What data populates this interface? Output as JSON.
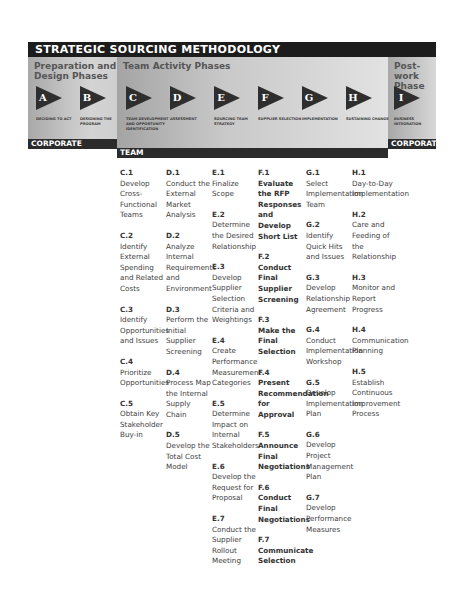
{
  "title": "STRATEGIC SOURCING METHODOLOGY",
  "colors": {
    "title_bar": "#1c1c1c",
    "triangle": "#2e2e2e",
    "footer_bar": "#2b2b2b"
  },
  "sections": {
    "prep": {
      "title_line1": "Preparation and",
      "title_line2": "Design Phases",
      "footer": "CORPORATE"
    },
    "team": {
      "title": "Team Activity Phases",
      "footer": "TEAM"
    },
    "post": {
      "title_line1": "Post-work",
      "title_line2": "Phase",
      "footer": "CORPORATE"
    }
  },
  "phases": [
    {
      "letter": "A",
      "label": "Deciding to Act"
    },
    {
      "letter": "B",
      "label": "Designing the Program"
    },
    {
      "letter": "C",
      "label": "Team Development and Opportunity Identification"
    },
    {
      "letter": "D",
      "label": "Assessment"
    },
    {
      "letter": "E",
      "label": "Sourcing Team Strategy"
    },
    {
      "letter": "F",
      "label": "Supplier Selection"
    },
    {
      "letter": "G",
      "label": "Implementation"
    },
    {
      "letter": "H",
      "label": "Sustaining Change"
    },
    {
      "letter": "I",
      "label": "Business Integration"
    }
  ],
  "columns": {
    "C": [
      {
        "id": "C.1",
        "text": "Develop Cross-Functional Teams"
      },
      {
        "id": "C.2",
        "text": "Identify External Spending and Related Costs"
      },
      {
        "id": "C.3",
        "text": "Identify Opportunities and Issues"
      },
      {
        "id": "C.4",
        "text": "Prioritize Opportunities"
      },
      {
        "id": "C.5",
        "text": "Obtain Key Stakeholder Buy-in"
      }
    ],
    "D": [
      {
        "id": "D.1",
        "text": "Conduct the External Market Analysis"
      },
      {
        "id": "D.2",
        "text": "Analyze Internal Requirements and Environment"
      },
      {
        "id": "D.3",
        "text": "Perform the Initial Supplier Screening"
      },
      {
        "id": "D.4",
        "text": "Process Map the Internal Supply Chain"
      },
      {
        "id": "D.5",
        "text": "Develop the Total Cost Model"
      }
    ],
    "E": [
      {
        "id": "E.1",
        "text": "Finalize Scope"
      },
      {
        "id": "E.2",
        "text": "Determine the Desired Relationship"
      },
      {
        "id": "E.3",
        "text": "Develop Supplier Selection Criteria and Weightings"
      },
      {
        "id": "E.4",
        "text": "Create Performance Measurement Categories"
      },
      {
        "id": "E.5",
        "text": "Determine Impact on Internal Stakeholders"
      },
      {
        "id": "E.6",
        "text": "Develop the Request for Proposal"
      },
      {
        "id": "E.7",
        "text": "Conduct the Supplier Rollout Meeting"
      }
    ],
    "F": [
      {
        "id": "F.1",
        "text": "Evaluate the RFP Responses and Develop Short List"
      },
      {
        "id": "F.2",
        "text": "Conduct Final Supplier Screening"
      },
      {
        "id": "F.3",
        "text": "Make the Final Selection"
      },
      {
        "id": "F.4",
        "text": "Present Recommendation for Approval"
      },
      {
        "id": "F.5",
        "text": "Announce Final Negotiations"
      },
      {
        "id": "F.6",
        "text": "Conduct Final Negotiations"
      },
      {
        "id": "F.7",
        "text": "Communicate Selection"
      }
    ],
    "G": [
      {
        "id": "G.1",
        "text": "Select Implementation Team"
      },
      {
        "id": "G.2",
        "text": "Identify Quick Hits and Issues"
      },
      {
        "id": "G.3",
        "text": "Develop Relationship Agreement"
      },
      {
        "id": "G.4",
        "text": "Conduct Implementation Workshop"
      },
      {
        "id": "G.5",
        "text": "Develop Implementation Plan"
      },
      {
        "id": "G.6",
        "text": "Develop Project Management Plan"
      },
      {
        "id": "G.7",
        "text": "Develop Performance Measures"
      }
    ],
    "H": [
      {
        "id": "H.1",
        "text": "Day-to-Day Implementation"
      },
      {
        "id": "H.2",
        "text": "Care and Feeding of the Relationship"
      },
      {
        "id": "H.3",
        "text": "Monitor and Report Progress"
      },
      {
        "id": "H.4",
        "text": "Communication Planning"
      },
      {
        "id": "H.5",
        "text": "Establish Continuous Improvement Process"
      }
    ]
  }
}
